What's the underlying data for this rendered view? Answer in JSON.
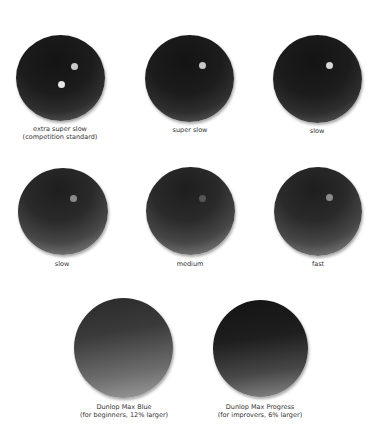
{
  "balls": [
    {
      "id": "extra-super-slow",
      "label": "extra super slow",
      "sublabel": "(competition standard)",
      "dots": 2,
      "dot_color": "#d9d9d9"
    },
    {
      "id": "super-slow",
      "label": "super slow",
      "sublabel": "",
      "dots": 1,
      "dot_color": "#c8c8c8"
    },
    {
      "id": "slow-top",
      "label": "slow",
      "sublabel": "",
      "dots": 1,
      "dot_color": "#d4d4d4"
    },
    {
      "id": "slow-bottom",
      "label": "slow",
      "sublabel": "",
      "dots": 1,
      "dot_color": "#8a8a8a"
    },
    {
      "id": "medium",
      "label": "medium",
      "sublabel": "",
      "dots": 1,
      "dot_color": "#555555"
    },
    {
      "id": "fast",
      "label": "fast",
      "sublabel": "",
      "dots": 1,
      "dot_color": "#8c8c8c"
    },
    {
      "id": "dunlop-max-blue",
      "label": "Dunlop Max Blue",
      "sublabel": "(for beginners, 12% larger)",
      "dots": 0,
      "dot_color": ""
    },
    {
      "id": "dunlop-max-progress",
      "label": "Dunlop Max Progress",
      "sublabel": "(for improvers, 6% larger)",
      "dots": 0,
      "dot_color": ""
    }
  ]
}
